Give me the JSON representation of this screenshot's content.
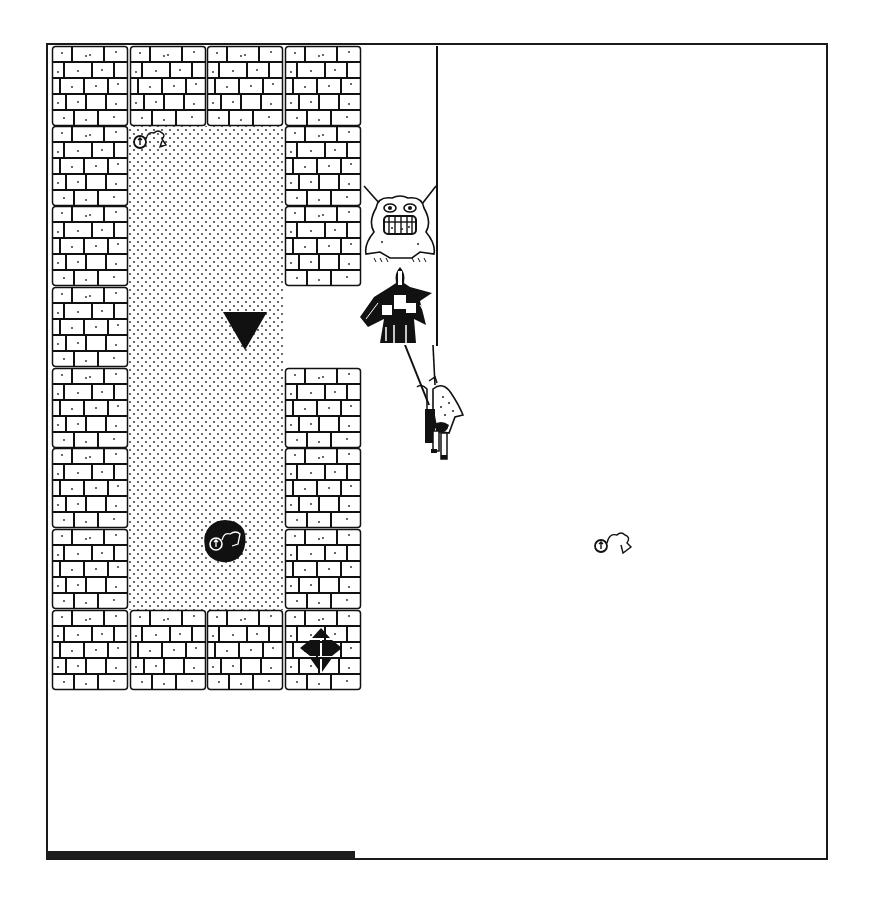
{
  "game": {
    "view": "dungeon-map",
    "colors": {
      "ink": "#111111",
      "paper": "#ffffff",
      "bar": "#1e1e1e"
    },
    "tile_size": 80,
    "grid": {
      "origin": [
        52,
        46
      ],
      "cols": 4,
      "rows": 8,
      "cells": [
        [
          "wall",
          "wall",
          "wall",
          "wall"
        ],
        [
          "wall",
          "floor",
          "floor",
          "wall"
        ],
        [
          "wall",
          "floor",
          "floor",
          "wall"
        ],
        [
          "wall",
          "floor",
          "floor",
          "door"
        ],
        [
          "wall",
          "floor",
          "floor",
          "wall"
        ],
        [
          "wall",
          "floor",
          "floor",
          "wall"
        ],
        [
          "wall",
          "floor",
          "floor",
          "wall"
        ],
        [
          "wall",
          "wall",
          "wall",
          "wall"
        ]
      ]
    },
    "entities": [
      {
        "name": "grinning-ogre-monster",
        "x": 362,
        "y": 182,
        "w": 76,
        "h": 84
      },
      {
        "name": "armored-knight-monster",
        "x": 360,
        "y": 265,
        "w": 78,
        "h": 82
      },
      {
        "name": "hero-adventurer",
        "x": 403,
        "y": 345,
        "w": 62,
        "h": 115
      },
      {
        "name": "key-ring-item",
        "x": 132,
        "y": 127,
        "w": 36,
        "h": 24
      },
      {
        "name": "key-ring-item",
        "x": 593,
        "y": 529,
        "w": 40,
        "h": 28
      },
      {
        "name": "dark-pit-with-key",
        "x": 202,
        "y": 518,
        "w": 46,
        "h": 46
      },
      {
        "name": "player-direction-marker",
        "x": 222,
        "y": 311,
        "w": 46,
        "h": 40
      },
      {
        "name": "direction-compass",
        "x": 298,
        "y": 626,
        "w": 46,
        "h": 48
      }
    ],
    "status_bar": {
      "label": "Health",
      "value_pct": 39
    }
  }
}
